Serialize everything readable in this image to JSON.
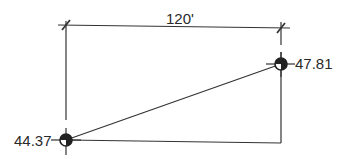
{
  "diagram": {
    "type": "site elevation / slope calculation sketch",
    "dimension": {
      "label": "120'"
    },
    "points": [
      {
        "id": "left",
        "elevation": "44.37"
      },
      {
        "id": "right",
        "elevation": "47.81"
      }
    ],
    "colors": {
      "line": "#333333",
      "text": "#2a2a2a",
      "background": "#ffffff"
    }
  }
}
